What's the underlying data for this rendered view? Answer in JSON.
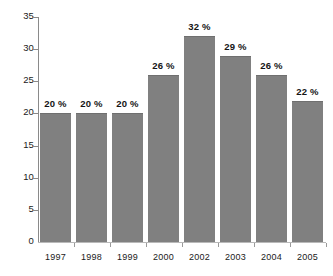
{
  "chart_data": {
    "type": "bar",
    "title": "",
    "subtitle": "",
    "xlabel": "",
    "ylabel": "",
    "categories": [
      "1997",
      "1998",
      "1999",
      "2000",
      "2002",
      "2003",
      "2004",
      "2005"
    ],
    "values": [
      20,
      20,
      20,
      26,
      32,
      29,
      26,
      22
    ],
    "data_labels": [
      "20 %",
      "20 %",
      "20 %",
      "26 %",
      "32 %",
      "29 %",
      "26 %",
      "22 %"
    ],
    "ylim": [
      0,
      35
    ],
    "y_ticks": [
      0,
      5,
      10,
      15,
      20,
      25,
      30,
      35
    ],
    "y_tick_labels": [
      "0",
      "5",
      "10",
      "15",
      "20",
      "25",
      "30",
      "35"
    ],
    "grid": false,
    "legend": null,
    "legend_position": "none",
    "colors": {
      "bar_fill": "#808080",
      "bar_edge": "#6f6f6f",
      "axis": "#8a8a8a",
      "x_axis": "#b9b9b9",
      "text": "#1a1a1a",
      "label_text": "#141414",
      "background": "#ffffff"
    }
  }
}
